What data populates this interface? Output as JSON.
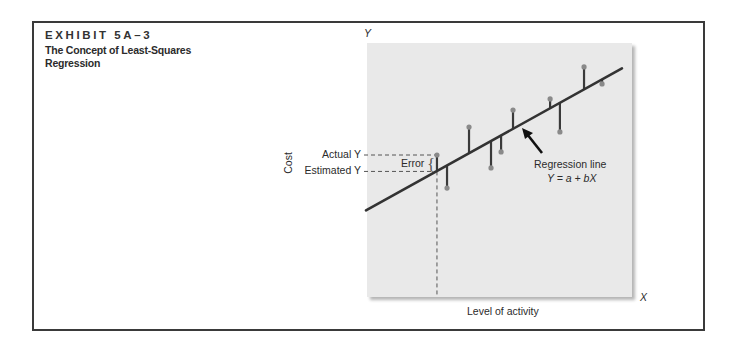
{
  "exhibit": {
    "label": "EXHIBIT 5A–3",
    "title": "The Concept of Least-Squares Regression"
  },
  "axes": {
    "y_letter": "Y",
    "x_letter": "X",
    "ylabel": "Cost",
    "xlabel": "Level of activity"
  },
  "annotations": {
    "actual_y": "Actual Y",
    "estimated_y": "Estimated Y",
    "error": "Error",
    "regression_line": "Regression line",
    "regression_equation": "Y = a + bX"
  },
  "colors": {
    "plot_background": "#e9e9e9",
    "line": "#333333",
    "point": "#8a8a8a",
    "error_bar": "#3a3a3a",
    "frame": "#3a3a3a"
  },
  "chart_data": {
    "type": "scatter",
    "title": "The Concept of Least-Squares Regression",
    "xlabel": "Level of activity",
    "ylabel": "Cost",
    "xlim": [
      0,
      100
    ],
    "ylim": [
      0,
      100
    ],
    "grid": false,
    "legend": "none",
    "note": "Conceptual diagram; no numeric ticks shown. Values on arbitrary 0–100 scale.",
    "regression_line": {
      "label": "Regression line",
      "equation": "Y = a + bX",
      "intercept": 34.1,
      "slope": 0.581,
      "x_range": [
        0,
        96.2
      ]
    },
    "points": [
      {
        "x": 26.4,
        "y": 55.9
      },
      {
        "x": 30.2,
        "y": 42.9
      },
      {
        "x": 38.5,
        "y": 66.9
      },
      {
        "x": 46.8,
        "y": 50.8
      },
      {
        "x": 50.6,
        "y": 57.1
      },
      {
        "x": 55.1,
        "y": 73.6
      },
      {
        "x": 69.1,
        "y": 78.0
      },
      {
        "x": 72.8,
        "y": 65.0
      },
      {
        "x": 81.9,
        "y": 90.6
      },
      {
        "x": 88.7,
        "y": 83.9
      }
    ],
    "highlighted_point_index": 0,
    "annotations": [
      "Actual Y",
      "Estimated Y",
      "Error",
      "Regression line",
      "Y = a + bX"
    ]
  }
}
